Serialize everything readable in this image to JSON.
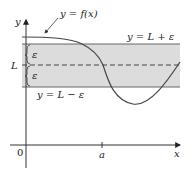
{
  "diagram": {
    "labels": {
      "y_axis": "y",
      "x_axis": "x",
      "origin": "0",
      "a_tick": "a",
      "L": "L",
      "epsilon_upper": "ε",
      "epsilon_lower": "ε",
      "curve": "y = f(x)",
      "upper_line": "y = L + ε",
      "lower_line": "y = L − ε"
    },
    "colors": {
      "band_fill": "#dcdcdc",
      "line": "#555555",
      "curve": "#444444",
      "text": "#222222"
    }
  }
}
